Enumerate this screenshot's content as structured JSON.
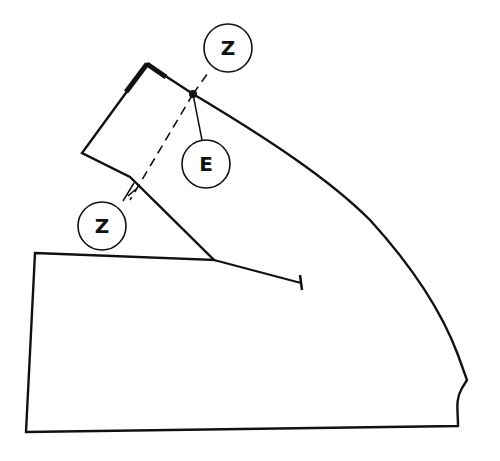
{
  "diagram": {
    "type": "pattern-piece",
    "stroke_color": "#111111",
    "background": "#ffffff",
    "labels": [
      {
        "id": "z-top",
        "text": "Z"
      },
      {
        "id": "e",
        "text": "E"
      },
      {
        "id": "z-left",
        "text": "Z"
      }
    ],
    "markers": {
      "point": "dot at seam intersection",
      "dart_end": "T-bar end of dart line"
    }
  }
}
